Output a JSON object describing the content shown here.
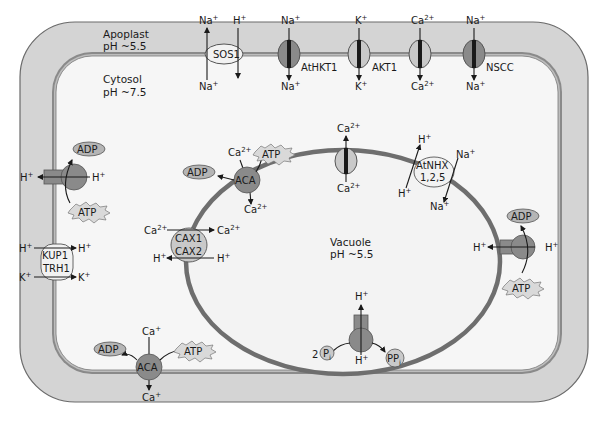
{
  "compartments": {
    "apoplast": {
      "name": "Apoplast",
      "ph": "pH ~5.5"
    },
    "cytosol": {
      "name": "Cytosol",
      "ph": "pH ~7.5"
    },
    "vacuole": {
      "name": "Vacuole",
      "ph": "pH ~5.5"
    }
  },
  "plasma_membrane_transporters": [
    {
      "id": "SOS1",
      "label": "SOS1",
      "type": "antiporter",
      "ions": [
        "Na+ out",
        "H+ in"
      ],
      "top_left": "Na",
      "top_right": "H",
      "bottom": "Na"
    },
    {
      "id": "AtHKT1",
      "label": "AtHKT1",
      "type": "channel",
      "ion_top": "Na",
      "ion_bottom": "Na"
    },
    {
      "id": "AKT1",
      "label": "AKT1",
      "type": "channel",
      "ion_top": "K",
      "ion_bottom": "K"
    },
    {
      "id": "Ca-channel-pm",
      "label": "",
      "type": "channel",
      "ion_top": "Ca",
      "ion_bottom": "Ca"
    },
    {
      "id": "NSCC",
      "label": "NSCC",
      "type": "channel",
      "ion_top": "Na",
      "ion_bottom": "Na"
    },
    {
      "id": "H-ATPase-pm",
      "label": "",
      "type": "pump",
      "out": "H",
      "in": "H",
      "atp": "ATP",
      "adp": "ADP"
    },
    {
      "id": "KUP1-TRH1",
      "label_line1": "KUP1",
      "label_line2": "TRH1",
      "type": "symporter",
      "ion1_left": "H",
      "ion1_right": "H",
      "ion2_left": "K",
      "ion2_right": "K"
    },
    {
      "id": "ACA-pm",
      "label": "ACA",
      "type": "pump",
      "ion_top": "Ca",
      "ion_bottom": "Ca",
      "atp": "ATP",
      "adp": "ADP"
    }
  ],
  "tonoplast_transporters": [
    {
      "id": "ACA-vac",
      "label": "ACA",
      "type": "pump",
      "ion_in": "Ca",
      "ion_out": "Ca",
      "atp": "ATP",
      "adp": "ADP"
    },
    {
      "id": "Ca-channel-vac",
      "label": "",
      "type": "channel",
      "ion_top": "Ca",
      "ion_bottom": "Ca"
    },
    {
      "id": "AtNHX",
      "label_line1": "AtNHX",
      "label_line2": "1,2,5",
      "type": "antiporter",
      "ions": [
        "H+",
        "Na+"
      ]
    },
    {
      "id": "CAX",
      "label_line1": "CAX1",
      "label_line2": "CAX2",
      "type": "antiporter",
      "ion1_left": "Ca",
      "ion1_right": "Ca",
      "ion2_left": "H",
      "ion2_right": "H"
    },
    {
      "id": "V-ATPase",
      "label": "",
      "type": "pump",
      "left": "H",
      "right": "H",
      "atp": "ATP",
      "adp": "ADP"
    },
    {
      "id": "V-PPase",
      "label": "",
      "type": "pump",
      "top": "H",
      "bottom": "H",
      "substrate_coef": "2",
      "substrate": "P",
      "substrate_sub": "i",
      "product": "PP",
      "product_sub": "i"
    }
  ],
  "ions": {
    "Na": "Na",
    "K": "K",
    "Ca": "Ca",
    "H": "H",
    "plus": "+",
    "twoplus": "2+"
  },
  "molecules": {
    "ATP": "ATP",
    "ADP": "ADP"
  },
  "colors": {
    "cell_wall": "#d4d4d4",
    "cell_wall_edge": "#6a6a6a",
    "cytosol": "#f6f6f6",
    "tonoplast": "#6e6e6e",
    "protein_dark": "#8a8a8a",
    "protein_light": "#c9c9c9",
    "line": "#1a1a1a"
  }
}
